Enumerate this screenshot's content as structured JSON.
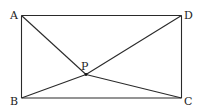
{
  "diagram": {
    "type": "geometry",
    "colors": {
      "stroke": "#2a2a2a",
      "text": "#222222",
      "background": "#ffffff"
    },
    "points": {
      "A": {
        "label": "A",
        "x": 21.5,
        "y": 15.5,
        "label_x": 10,
        "label_y": 19
      },
      "B": {
        "label": "B",
        "x": 21.5,
        "y": 98,
        "label_x": 10,
        "label_y": 105
      },
      "C": {
        "label": "C",
        "x": 181.5,
        "y": 98,
        "label_x": 184,
        "label_y": 105
      },
      "D": {
        "label": "D",
        "x": 181.5,
        "y": 15.5,
        "label_x": 184,
        "label_y": 19
      },
      "P": {
        "label": "P",
        "x": 86,
        "y": 74.5,
        "label_x": 81,
        "label_y": 70
      }
    },
    "segments": [
      [
        "A",
        "D"
      ],
      [
        "D",
        "C"
      ],
      [
        "C",
        "B"
      ],
      [
        "B",
        "A"
      ],
      [
        "A",
        "P"
      ],
      [
        "B",
        "P"
      ],
      [
        "C",
        "P"
      ],
      [
        "D",
        "P"
      ]
    ]
  }
}
